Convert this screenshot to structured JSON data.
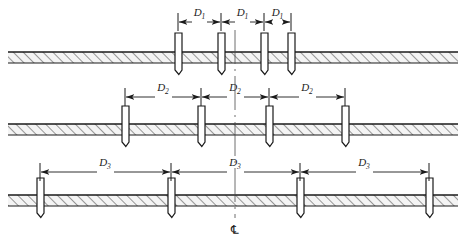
{
  "figure": {
    "centerline_symbol": "℄",
    "centerline_name": "centerline",
    "colors": {
      "line": "#1a1a1a",
      "ground_fill": "#f2f2f2",
      "hatch": "#555555",
      "pile_fill": "#ffffff",
      "background": "#ffffff"
    }
  },
  "rows": [
    {
      "id": "row-1",
      "label": "D",
      "subscript": "1",
      "dimension_count": 3,
      "pile_count": 4,
      "ground_y": 52,
      "ground_height": 11,
      "dim_y": 22,
      "piles": [
        178,
        221,
        264,
        291
      ],
      "dim_ticks": [
        178,
        221,
        264,
        291
      ],
      "dim_labels": [
        {
          "x": 199.5,
          "y": 16
        },
        {
          "x": 242.5,
          "y": 16
        },
        {
          "x": 277.5,
          "y": 16
        }
      ]
    },
    {
      "id": "row-2",
      "label": "D",
      "subscript": "2",
      "dimension_count": 3,
      "pile_count": 4,
      "ground_y": 124,
      "ground_height": 11,
      "dim_y": 97,
      "piles": [
        125,
        201,
        269,
        345
      ],
      "dim_ticks": [
        125,
        201,
        269,
        345
      ],
      "dim_labels": [
        {
          "x": 163,
          "y": 91
        },
        {
          "x": 235,
          "y": 91
        },
        {
          "x": 307,
          "y": 91
        }
      ]
    },
    {
      "id": "row-3",
      "label": "D",
      "subscript": "3",
      "dimension_count": 3,
      "pile_count": 4,
      "ground_y": 195,
      "ground_height": 11,
      "dim_y": 172,
      "piles": [
        40,
        171,
        300,
        429
      ],
      "dim_ticks": [
        40,
        171,
        300,
        429
      ],
      "dim_labels": [
        {
          "x": 105,
          "y": 166
        },
        {
          "x": 235,
          "y": 166
        },
        {
          "x": 364,
          "y": 166
        }
      ]
    }
  ],
  "centerline": {
    "x": 235,
    "top": 30,
    "bottom": 218,
    "symbol_x": 235,
    "symbol_y": 234
  },
  "ground_extent": {
    "left": 8,
    "right": 458
  }
}
